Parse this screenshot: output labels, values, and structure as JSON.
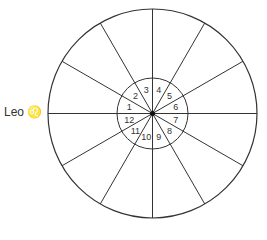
{
  "diagram": {
    "type": "astrological-house-wheel",
    "center": [
      152.5,
      113.5
    ],
    "outer_radius": 104.5,
    "inner_radius": 35.5,
    "divisions": 12,
    "line_color": "#333333",
    "houses": [
      {
        "number": "1"
      },
      {
        "number": "2"
      },
      {
        "number": "3"
      },
      {
        "number": "4"
      },
      {
        "number": "5"
      },
      {
        "number": "6"
      },
      {
        "number": "7"
      },
      {
        "number": "8"
      },
      {
        "number": "9"
      },
      {
        "number": "10"
      },
      {
        "number": "11"
      },
      {
        "number": "12"
      }
    ],
    "ascendant_label": {
      "sign": "Leo",
      "glyph": "♌"
    }
  }
}
